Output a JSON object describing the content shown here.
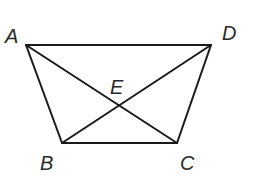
{
  "diagram": {
    "type": "trapezoid-with-diagonals",
    "points": {
      "A": {
        "label": "A",
        "x": 26,
        "y": 45
      },
      "D": {
        "label": "D",
        "x": 211,
        "y": 45
      },
      "B": {
        "label": "B",
        "x": 62,
        "y": 143
      },
      "C": {
        "label": "C",
        "x": 177,
        "y": 143
      },
      "E": {
        "label": "E",
        "x": 119,
        "y": 106
      }
    },
    "segments": [
      {
        "name": "AD",
        "from": "A",
        "to": "D"
      },
      {
        "name": "AB",
        "from": "A",
        "to": "B"
      },
      {
        "name": "BC",
        "from": "B",
        "to": "C"
      },
      {
        "name": "CD",
        "from": "C",
        "to": "D"
      },
      {
        "name": "AC",
        "from": "A",
        "to": "C"
      },
      {
        "name": "BD",
        "from": "B",
        "to": "D"
      }
    ],
    "labels": {
      "A": "A",
      "B": "B",
      "C": "C",
      "D": "D",
      "E": "E"
    },
    "colors": {
      "line": "#1a1a1a",
      "text": "#2a2a2a",
      "background": "#ffffff"
    }
  }
}
